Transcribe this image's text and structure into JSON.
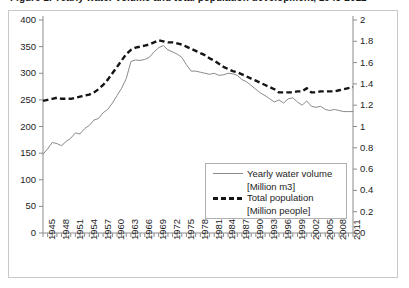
{
  "caption": {
    "text": "Figure 1. Yearly water volume and total population development, 1945-2012"
  },
  "legend": {
    "series1_label": "Yearly water volume",
    "series1_unit": "[Million m3]",
    "series1_style": "solid-thin-line",
    "series2_label": "Total population",
    "series2_unit": "[Million people]",
    "series2_style": "thick-dashed-line"
  },
  "colors": {
    "series1": "#8a8a8a",
    "series2": "#141414",
    "axis": "#8c8c8c",
    "frame": "#c9c9c9",
    "text": "#1d1d1d"
  },
  "chart_data": {
    "type": "line",
    "title": "",
    "xlabel": "",
    "ylabel": "",
    "grid": false,
    "legend_position": "inside-lower-right",
    "xlim": [
      1945,
      2012
    ],
    "x_tick_step": 3,
    "x_minor_tick_step": 1,
    "xticks": [
      1945,
      1948,
      1951,
      1954,
      1957,
      1960,
      1963,
      1966,
      1969,
      1972,
      1975,
      1978,
      1981,
      1984,
      1987,
      1990,
      1993,
      1996,
      1999,
      2002,
      2005,
      2008,
      2011
    ],
    "y_left": {
      "label": "Yearly water volume [Million m3]",
      "ylim": [
        0,
        400
      ],
      "ticks": [
        0,
        50,
        100,
        150,
        200,
        250,
        300,
        350,
        400
      ]
    },
    "y_right": {
      "label": "Total population [Million people]",
      "ylim": [
        0,
        2
      ],
      "ticks": [
        0,
        0.2,
        0.4,
        0.6,
        0.8,
        1,
        1.2,
        1.4,
        1.6,
        1.8,
        2
      ]
    },
    "x": [
      1945,
      1946,
      1947,
      1948,
      1949,
      1950,
      1951,
      1952,
      1953,
      1954,
      1955,
      1956,
      1957,
      1958,
      1959,
      1960,
      1961,
      1962,
      1963,
      1964,
      1965,
      1966,
      1967,
      1968,
      1969,
      1970,
      1971,
      1972,
      1973,
      1974,
      1975,
      1976,
      1977,
      1978,
      1979,
      1980,
      1981,
      1982,
      1983,
      1984,
      1985,
      1986,
      1987,
      1988,
      1989,
      1990,
      1991,
      1992,
      1993,
      1994,
      1995,
      1996,
      1997,
      1998,
      1999,
      2000,
      2001,
      2002,
      2003,
      2004,
      2005,
      2006,
      2007,
      2008,
      2009,
      2010,
      2011,
      2012
    ],
    "series": [
      {
        "name": "Yearly water volume",
        "axis": "left",
        "unit": "Million m3",
        "values": [
          148,
          158,
          170,
          168,
          164,
          172,
          178,
          188,
          186,
          196,
          202,
          212,
          215,
          226,
          232,
          244,
          258,
          272,
          290,
          322,
          325,
          324,
          326,
          330,
          340,
          348,
          352,
          344,
          340,
          336,
          330,
          316,
          304,
          304,
          302,
          300,
          298,
          300,
          296,
          297,
          300,
          299,
          296,
          288,
          284,
          277,
          270,
          263,
          258,
          252,
          246,
          250,
          244,
          252,
          254,
          246,
          240,
          248,
          238,
          236,
          238,
          232,
          230,
          232,
          230,
          228,
          228,
          228
        ]
      },
      {
        "name": "Total population",
        "axis": "right",
        "unit": "Million people",
        "values": [
          1.24,
          1.25,
          1.26,
          1.27,
          1.26,
          1.26,
          1.26,
          1.27,
          1.28,
          1.29,
          1.3,
          1.32,
          1.35,
          1.39,
          1.44,
          1.5,
          1.56,
          1.62,
          1.68,
          1.72,
          1.74,
          1.75,
          1.76,
          1.77,
          1.79,
          1.81,
          1.8,
          1.79,
          1.79,
          1.78,
          1.77,
          1.75,
          1.73,
          1.71,
          1.69,
          1.67,
          1.64,
          1.62,
          1.59,
          1.56,
          1.54,
          1.52,
          1.51,
          1.49,
          1.47,
          1.45,
          1.43,
          1.41,
          1.39,
          1.37,
          1.35,
          1.32,
          1.32,
          1.32,
          1.32,
          1.33,
          1.33,
          1.36,
          1.32,
          1.32,
          1.33,
          1.33,
          1.33,
          1.33,
          1.34,
          1.35,
          1.36,
          1.37
        ]
      }
    ]
  }
}
